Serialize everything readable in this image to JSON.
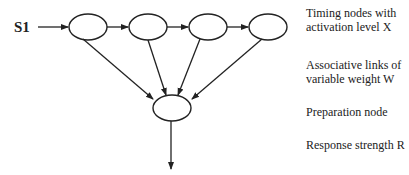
{
  "diagram": {
    "input_label": "S1",
    "legend": [
      {
        "line1": "Timing nodes with",
        "line2": "activation level X"
      },
      {
        "line1": "Associative links of",
        "line2": "variable weight W"
      },
      {
        "line1": "Preparation node",
        "line2": ""
      },
      {
        "line1": "Response strength R",
        "line2": ""
      }
    ],
    "timing_nodes": [
      {
        "cx": 88,
        "cy": 27
      },
      {
        "cx": 148,
        "cy": 27
      },
      {
        "cx": 208,
        "cy": 27
      },
      {
        "cx": 268,
        "cy": 27
      }
    ],
    "preparation_node": {
      "cx": 172,
      "cy": 108
    },
    "colors": {
      "stroke": "#222222",
      "background": "#ffffff"
    }
  }
}
